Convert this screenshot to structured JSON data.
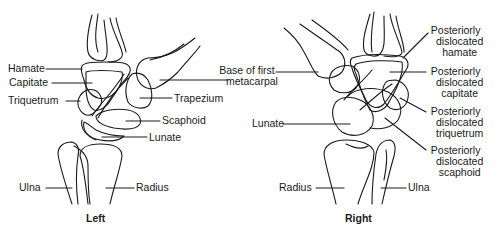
{
  "figure": {
    "panels": [
      {
        "caption": "Left",
        "labels": {
          "hamate": "Hamate",
          "capitate": "Capitate",
          "triquetrum": "Triquetrum",
          "trapezium": "Trapezium",
          "scaphoid": "Scaphoid",
          "lunate": "Lunate",
          "ulna": "Ulna",
          "radius": "Radius"
        }
      },
      {
        "caption": "Right",
        "labels": {
          "lunate": "Lunate",
          "radius": "Radius",
          "ulna": "Ulna",
          "hamate": [
            "Posteriorly",
            "dislocated",
            "hamate"
          ],
          "capitate": [
            "Posteriorly",
            "dislocated",
            "capitate"
          ],
          "triquetrum": [
            "Posteriorly",
            "dislocated",
            "triquetrum"
          ],
          "scaphoid": [
            "Posteriorly",
            "dislocated",
            "scaphoid"
          ]
        }
      }
    ],
    "shared_label": [
      "Base of first",
      "metacarpal"
    ],
    "colors": {
      "line": "#1a1a1a",
      "background": "#ffffff"
    }
  }
}
